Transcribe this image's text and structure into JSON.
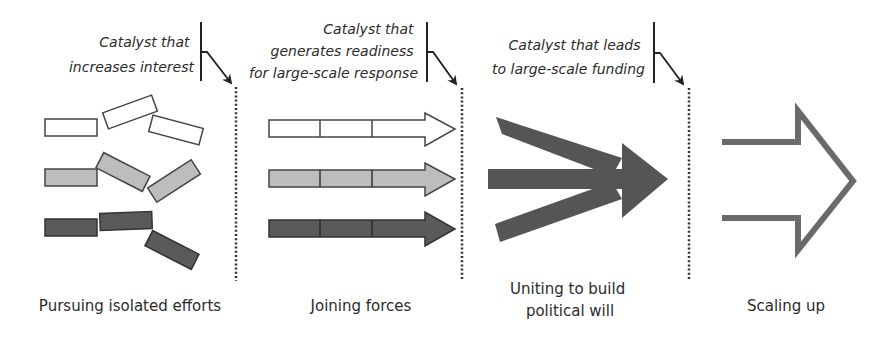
{
  "diagram": {
    "colors": {
      "background": "#ffffff",
      "ink": "#222222",
      "white_fill": "#ffffff",
      "light_gray_fill": "#bdbdbd",
      "dark_gray_fill": "#5a5a5a",
      "converge_fill": "#555555",
      "scale_stroke": "#6a6a6a",
      "divider": "#333333"
    },
    "catalysts": [
      {
        "lines": [
          "Catalyst that",
          "increases interest"
        ]
      },
      {
        "lines": [
          "Catalyst that",
          "generates readiness",
          "for large-scale response"
        ]
      },
      {
        "lines": [
          "Catalyst that leads",
          "to large-scale funding"
        ]
      }
    ],
    "stages": [
      {
        "id": "isolated",
        "label_lines": [
          "Pursuing isolated efforts"
        ],
        "icon": "scattered-bars-icon"
      },
      {
        "id": "joining",
        "label_lines": [
          "Joining forces"
        ],
        "icon": "parallel-arrows-icon"
      },
      {
        "id": "uniting",
        "label_lines": [
          "Uniting to build",
          "political will"
        ],
        "icon": "converging-arrow-icon"
      },
      {
        "id": "scaling",
        "label_lines": [
          "Scaling up"
        ],
        "icon": "outline-arrow-icon"
      }
    ]
  }
}
